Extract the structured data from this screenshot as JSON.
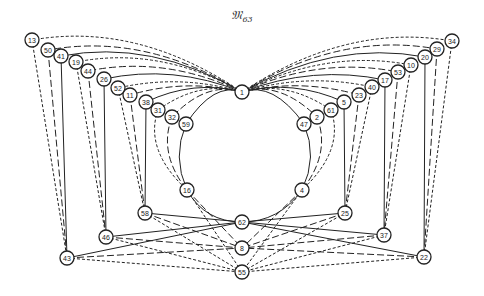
{
  "title": {
    "main": "𝔐",
    "subscript": "63"
  },
  "diagram": {
    "type": "graph",
    "hub_node": "1",
    "nodes": [
      {
        "id": "13",
        "x": 32,
        "y": 40
      },
      {
        "id": "50",
        "x": 48,
        "y": 50
      },
      {
        "id": "41",
        "x": 61,
        "y": 56
      },
      {
        "id": "19",
        "x": 76,
        "y": 62
      },
      {
        "id": "44",
        "x": 88,
        "y": 71
      },
      {
        "id": "26",
        "x": 104,
        "y": 79
      },
      {
        "id": "52",
        "x": 118,
        "y": 88
      },
      {
        "id": "11",
        "x": 130,
        "y": 95
      },
      {
        "id": "38",
        "x": 146,
        "y": 102
      },
      {
        "id": "31",
        "x": 158,
        "y": 110
      },
      {
        "id": "32",
        "x": 172,
        "y": 117
      },
      {
        "id": "59",
        "x": 186,
        "y": 124
      },
      {
        "id": "1",
        "x": 242,
        "y": 92
      },
      {
        "id": "34",
        "x": 452,
        "y": 41
      },
      {
        "id": "29",
        "x": 437,
        "y": 49
      },
      {
        "id": "20",
        "x": 425,
        "y": 57
      },
      {
        "id": "10",
        "x": 411,
        "y": 65
      },
      {
        "id": "53",
        "x": 398,
        "y": 72
      },
      {
        "id": "17",
        "x": 385,
        "y": 80
      },
      {
        "id": "40",
        "x": 372,
        "y": 87
      },
      {
        "id": "23",
        "x": 359,
        "y": 95
      },
      {
        "id": "5",
        "x": 344,
        "y": 102
      },
      {
        "id": "61",
        "x": 331,
        "y": 110
      },
      {
        "id": "2",
        "x": 317,
        "y": 117
      },
      {
        "id": "47",
        "x": 304,
        "y": 124
      },
      {
        "id": "16",
        "x": 187,
        "y": 190
      },
      {
        "id": "4",
        "x": 302,
        "y": 190
      },
      {
        "id": "62",
        "x": 242,
        "y": 222
      },
      {
        "id": "58",
        "x": 145,
        "y": 213
      },
      {
        "id": "25",
        "x": 345,
        "y": 213
      },
      {
        "id": "46",
        "x": 106,
        "y": 237
      },
      {
        "id": "37",
        "x": 384,
        "y": 235
      },
      {
        "id": "8",
        "x": 242,
        "y": 248
      },
      {
        "id": "43",
        "x": 67,
        "y": 258
      },
      {
        "id": "22",
        "x": 424,
        "y": 257
      },
      {
        "id": "55",
        "x": 242,
        "y": 272
      }
    ],
    "edges": [
      {
        "from": "1",
        "to": "13",
        "style": "dash-short"
      },
      {
        "from": "1",
        "to": "50",
        "style": "dash-long"
      },
      {
        "from": "1",
        "to": "41",
        "style": "solid"
      },
      {
        "from": "1",
        "to": "19",
        "style": "dash-short"
      },
      {
        "from": "1",
        "to": "44",
        "style": "dash-long"
      },
      {
        "from": "1",
        "to": "26",
        "style": "solid"
      },
      {
        "from": "1",
        "to": "52",
        "style": "dash-short"
      },
      {
        "from": "1",
        "to": "11",
        "style": "dash-long"
      },
      {
        "from": "1",
        "to": "38",
        "style": "solid"
      },
      {
        "from": "1",
        "to": "31",
        "style": "dash-short"
      },
      {
        "from": "1",
        "to": "32",
        "style": "dash-long"
      },
      {
        "from": "1",
        "to": "59",
        "style": "solid"
      },
      {
        "from": "1",
        "to": "34",
        "style": "dash-short"
      },
      {
        "from": "1",
        "to": "29",
        "style": "dash-long"
      },
      {
        "from": "1",
        "to": "20",
        "style": "solid"
      },
      {
        "from": "1",
        "to": "10",
        "style": "dash-short"
      },
      {
        "from": "1",
        "to": "53",
        "style": "dash-long"
      },
      {
        "from": "1",
        "to": "17",
        "style": "solid"
      },
      {
        "from": "1",
        "to": "40",
        "style": "dash-short"
      },
      {
        "from": "1",
        "to": "23",
        "style": "dash-long"
      },
      {
        "from": "1",
        "to": "5",
        "style": "solid"
      },
      {
        "from": "1",
        "to": "61",
        "style": "dash-short"
      },
      {
        "from": "1",
        "to": "2",
        "style": "dash-long"
      },
      {
        "from": "1",
        "to": "47",
        "style": "solid"
      },
      {
        "from": "13",
        "to": "43",
        "style": "dash-short"
      },
      {
        "from": "50",
        "to": "43",
        "style": "dash-long"
      },
      {
        "from": "41",
        "to": "43",
        "style": "solid"
      },
      {
        "from": "19",
        "to": "46",
        "style": "dash-short"
      },
      {
        "from": "44",
        "to": "46",
        "style": "dash-long"
      },
      {
        "from": "26",
        "to": "46",
        "style": "solid"
      },
      {
        "from": "52",
        "to": "58",
        "style": "dash-short"
      },
      {
        "from": "11",
        "to": "58",
        "style": "dash-long"
      },
      {
        "from": "38",
        "to": "58",
        "style": "solid"
      },
      {
        "from": "31",
        "to": "16",
        "style": "dash-short"
      },
      {
        "from": "32",
        "to": "16",
        "style": "dash-long"
      },
      {
        "from": "59",
        "to": "16",
        "style": "solid"
      },
      {
        "from": "34",
        "to": "22",
        "style": "dash-short"
      },
      {
        "from": "29",
        "to": "22",
        "style": "dash-long"
      },
      {
        "from": "20",
        "to": "22",
        "style": "solid"
      },
      {
        "from": "10",
        "to": "37",
        "style": "dash-short"
      },
      {
        "from": "53",
        "to": "37",
        "style": "dash-long"
      },
      {
        "from": "17",
        "to": "37",
        "style": "solid"
      },
      {
        "from": "40",
        "to": "25",
        "style": "dash-short"
      },
      {
        "from": "23",
        "to": "25",
        "style": "dash-long"
      },
      {
        "from": "5",
        "to": "25",
        "style": "solid"
      },
      {
        "from": "61",
        "to": "4",
        "style": "dash-short"
      },
      {
        "from": "2",
        "to": "4",
        "style": "dash-long"
      },
      {
        "from": "47",
        "to": "4",
        "style": "solid"
      },
      {
        "from": "16",
        "to": "62",
        "style": "solid"
      },
      {
        "from": "4",
        "to": "62",
        "style": "solid"
      },
      {
        "from": "16",
        "to": "8",
        "style": "dash-long"
      },
      {
        "from": "4",
        "to": "8",
        "style": "dash-long"
      },
      {
        "from": "16",
        "to": "55",
        "style": "dash-short"
      },
      {
        "from": "4",
        "to": "55",
        "style": "dash-short"
      },
      {
        "from": "58",
        "to": "62",
        "style": "solid"
      },
      {
        "from": "58",
        "to": "8",
        "style": "dash-long"
      },
      {
        "from": "58",
        "to": "55",
        "style": "dash-short"
      },
      {
        "from": "25",
        "to": "62",
        "style": "solid"
      },
      {
        "from": "25",
        "to": "8",
        "style": "dash-long"
      },
      {
        "from": "25",
        "to": "55",
        "style": "dash-short"
      },
      {
        "from": "46",
        "to": "62",
        "style": "solid"
      },
      {
        "from": "46",
        "to": "8",
        "style": "dash-long"
      },
      {
        "from": "46",
        "to": "55",
        "style": "dash-short"
      },
      {
        "from": "37",
        "to": "62",
        "style": "solid"
      },
      {
        "from": "37",
        "to": "8",
        "style": "dash-long"
      },
      {
        "from": "37",
        "to": "55",
        "style": "dash-short"
      },
      {
        "from": "43",
        "to": "62",
        "style": "solid"
      },
      {
        "from": "43",
        "to": "8",
        "style": "dash-long"
      },
      {
        "from": "43",
        "to": "55",
        "style": "dash-short"
      },
      {
        "from": "22",
        "to": "62",
        "style": "solid"
      },
      {
        "from": "22",
        "to": "8",
        "style": "dash-long"
      },
      {
        "from": "22",
        "to": "55",
        "style": "dash-short"
      }
    ]
  }
}
